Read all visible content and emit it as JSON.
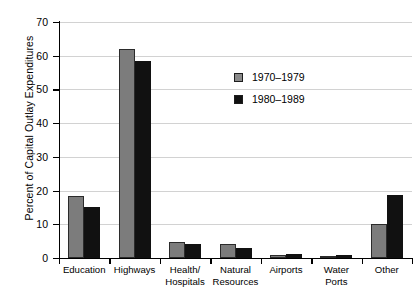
{
  "chart_data": {
    "type": "bar",
    "title": "",
    "xlabel": "",
    "ylabel": "Percent of Capital Outlay Expenditures",
    "ylim": [
      0,
      70
    ],
    "yticks": [
      0,
      10,
      20,
      30,
      40,
      50,
      60,
      70
    ],
    "grid": true,
    "legend_position": "inside-upper-center-right",
    "categories": [
      "Education",
      "Highways",
      "Health/ Hospitals",
      "Natural Resources",
      "Airports",
      "Water Ports",
      "Other"
    ],
    "category_lines": [
      [
        "Education"
      ],
      [
        "Highways"
      ],
      [
        "Health/",
        "Hospitals"
      ],
      [
        "Natural",
        "Resources"
      ],
      [
        "Airports"
      ],
      [
        "Water",
        "Ports"
      ],
      [
        "Other"
      ]
    ],
    "series": [
      {
        "name": "1970–1979",
        "color": "#7c7c7c",
        "values": [
          18.5,
          62.0,
          4.8,
          4.3,
          1.0,
          0.6,
          10.0
        ]
      },
      {
        "name": "1980–1989",
        "color": "#111111",
        "values": [
          15.2,
          58.5,
          4.3,
          3.0,
          1.1,
          0.9,
          18.6
        ]
      }
    ]
  },
  "legend": {
    "items": [
      {
        "label": "1970–1979",
        "swatch": "gray"
      },
      {
        "label": "1980–1989",
        "swatch": "black"
      }
    ]
  },
  "axis": {
    "y_title": "Percent of Capital Outlay Expenditures",
    "y_tick_labels": [
      "70",
      "60",
      "50",
      "40",
      "30",
      "20",
      "10",
      "0"
    ]
  }
}
